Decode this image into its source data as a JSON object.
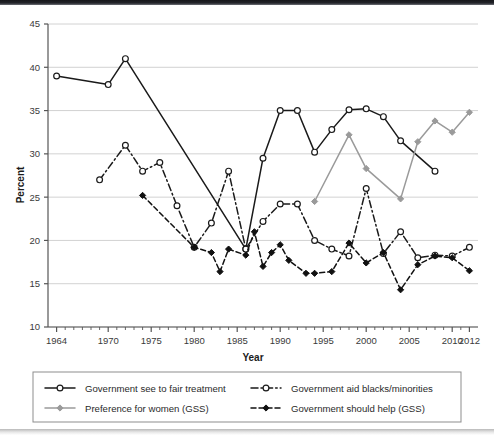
{
  "chart_data": {
    "type": "line",
    "title": "",
    "xlabel": "Year",
    "ylabel": "Percent",
    "xlim": [
      1963,
      2013
    ],
    "ylim": [
      10,
      45
    ],
    "ytick_step": 5,
    "yticks": [
      10,
      15,
      20,
      25,
      30,
      35,
      40,
      45
    ],
    "xticks_labeled": [
      1964,
      1970,
      1975,
      1980,
      1985,
      1990,
      1995,
      2000,
      2005,
      2010,
      2012
    ],
    "xtick_minor_step": 1,
    "grid": "horizontal",
    "legend_position": "bottom",
    "series": [
      {
        "name": "Government see to fair treatment",
        "style": "solid",
        "color": "#1a1a1a",
        "marker": "open-circle",
        "points": [
          {
            "x": 1964,
            "y": 39.0
          },
          {
            "x": 1970,
            "y": 38.0
          },
          {
            "x": 1972,
            "y": 41.0
          },
          {
            "x": 1986,
            "y": 19.0
          },
          {
            "x": 1988,
            "y": 29.5
          },
          {
            "x": 1990,
            "y": 35.0
          },
          {
            "x": 1992,
            "y": 35.0
          },
          {
            "x": 1994,
            "y": 30.2
          },
          {
            "x": 1996,
            "y": 32.8
          },
          {
            "x": 1998,
            "y": 35.1
          },
          {
            "x": 2000,
            "y": 35.2
          },
          {
            "x": 2002,
            "y": 34.3
          },
          {
            "x": 2004,
            "y": 31.5
          },
          {
            "x": 2008,
            "y": 28.0
          }
        ]
      },
      {
        "name": "Government aid blacks/minorities",
        "style": "dash-dot",
        "color": "#1a1a1a",
        "marker": "open-circle",
        "points": [
          {
            "x": 1969,
            "y": 27.0
          },
          {
            "x": 1972,
            "y": 31.0
          },
          {
            "x": 1974,
            "y": 28.0
          },
          {
            "x": 1976,
            "y": 29.0
          },
          {
            "x": 1978,
            "y": 24.0
          },
          {
            "x": 1980,
            "y": 19.2
          },
          {
            "x": 1982,
            "y": 22.0
          },
          {
            "x": 1984,
            "y": 28.0
          },
          {
            "x": 1986,
            "y": 19.0
          },
          {
            "x": 1988,
            "y": 22.2
          },
          {
            "x": 1990,
            "y": 24.2
          },
          {
            "x": 1992,
            "y": 24.2
          },
          {
            "x": 1994,
            "y": 20.0
          },
          {
            "x": 1996,
            "y": 19.0
          },
          {
            "x": 1998,
            "y": 18.2
          },
          {
            "x": 2000,
            "y": 26.0
          },
          {
            "x": 2002,
            "y": 18.5
          },
          {
            "x": 2004,
            "y": 21.0
          },
          {
            "x": 2006,
            "y": 18.0
          },
          {
            "x": 2008,
            "y": 18.3
          },
          {
            "x": 2010,
            "y": 18.2
          },
          {
            "x": 2012,
            "y": 19.2
          }
        ]
      },
      {
        "name": "Preference for women (GSS)",
        "style": "solid",
        "color": "#9a9a9a",
        "marker": "filled-diamond",
        "points": [
          {
            "x": 1994,
            "y": 24.5
          },
          {
            "x": 1998,
            "y": 32.2
          },
          {
            "x": 2000,
            "y": 28.3
          },
          {
            "x": 2004,
            "y": 24.8
          },
          {
            "x": 2006,
            "y": 31.4
          },
          {
            "x": 2008,
            "y": 33.8
          },
          {
            "x": 2010,
            "y": 32.5
          },
          {
            "x": 2012,
            "y": 34.8
          }
        ]
      },
      {
        "name": "Government should help (GSS)",
        "style": "dashed",
        "color": "#111111",
        "marker": "filled-diamond",
        "points": [
          {
            "x": 1974,
            "y": 25.2
          },
          {
            "x": 1980,
            "y": 19.2
          },
          {
            "x": 1982,
            "y": 18.6
          },
          {
            "x": 1983,
            "y": 16.4
          },
          {
            "x": 1984,
            "y": 19.0
          },
          {
            "x": 1986,
            "y": 18.3
          },
          {
            "x": 1987,
            "y": 21.0
          },
          {
            "x": 1988,
            "y": 17.0
          },
          {
            "x": 1989,
            "y": 18.6
          },
          {
            "x": 1990,
            "y": 19.5
          },
          {
            "x": 1991,
            "y": 17.7
          },
          {
            "x": 1993,
            "y": 16.2
          },
          {
            "x": 1994,
            "y": 16.2
          },
          {
            "x": 1996,
            "y": 16.4
          },
          {
            "x": 1998,
            "y": 19.7
          },
          {
            "x": 2000,
            "y": 17.4
          },
          {
            "x": 2002,
            "y": 18.6
          },
          {
            "x": 2004,
            "y": 14.3
          },
          {
            "x": 2006,
            "y": 17.2
          },
          {
            "x": 2008,
            "y": 18.2
          },
          {
            "x": 2010,
            "y": 18.0
          },
          {
            "x": 2012,
            "y": 16.5
          }
        ]
      }
    ]
  },
  "axes": {
    "ylabel": "Percent",
    "xlabel": "Year",
    "ytick_labels": [
      "45",
      "40",
      "35",
      "30",
      "25",
      "20",
      "15",
      "10"
    ],
    "xtick_labels": [
      "1964",
      "1970",
      "1975",
      "1980",
      "1985",
      "1990",
      "1995",
      "2000",
      "2005",
      "2010",
      "2012"
    ]
  },
  "legend": {
    "entries": [
      {
        "label": "Government see to fair treatment",
        "style": "solid",
        "marker": "open-circle",
        "color": "#1a1a1a"
      },
      {
        "label": "Government aid blacks/minorities",
        "style": "dash-dot",
        "marker": "open-circle",
        "color": "#1a1a1a"
      },
      {
        "label": "Preference for women (GSS)",
        "style": "solid",
        "marker": "filled-diamond",
        "color": "#9a9a9a"
      },
      {
        "label": "Government should help (GSS)",
        "style": "dashed",
        "marker": "filled-diamond",
        "color": "#111111"
      }
    ]
  },
  "colors": {
    "grid": "#d2d2d2",
    "axis": "#555555",
    "text": "#2a2a2a",
    "background": "#ffffff"
  }
}
